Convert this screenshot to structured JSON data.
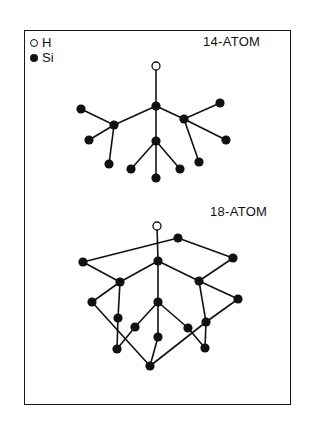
{
  "legend": {
    "items": [
      {
        "symbol": "open-circle",
        "label": "H"
      },
      {
        "symbol": "filled-circle",
        "label": "Si"
      }
    ]
  },
  "clusters": [
    {
      "title": "14-ATOM",
      "atoms": [
        {
          "id": "H",
          "type": "H",
          "x": 156,
          "y": 66
        },
        {
          "id": "c",
          "type": "Si",
          "x": 156,
          "y": 106
        },
        {
          "id": "l",
          "type": "Si",
          "x": 114,
          "y": 125
        },
        {
          "id": "r",
          "type": "Si",
          "x": 184,
          "y": 119
        },
        {
          "id": "m",
          "type": "Si",
          "x": 156,
          "y": 141
        },
        {
          "id": "l1",
          "type": "Si",
          "x": 81,
          "y": 109
        },
        {
          "id": "l2",
          "type": "Si",
          "x": 89,
          "y": 140
        },
        {
          "id": "l3",
          "type": "Si",
          "x": 109,
          "y": 164
        },
        {
          "id": "m1",
          "type": "Si",
          "x": 131,
          "y": 169
        },
        {
          "id": "m2",
          "type": "Si",
          "x": 156,
          "y": 178
        },
        {
          "id": "m3",
          "type": "Si",
          "x": 180,
          "y": 169
        },
        {
          "id": "r1",
          "type": "Si",
          "x": 220,
          "y": 103
        },
        {
          "id": "r2",
          "type": "Si",
          "x": 226,
          "y": 140
        },
        {
          "id": "r3",
          "type": "Si",
          "x": 199,
          "y": 162
        }
      ],
      "bonds": [
        [
          "H",
          "c"
        ],
        [
          "c",
          "l"
        ],
        [
          "c",
          "r"
        ],
        [
          "c",
          "m"
        ],
        [
          "l",
          "l1"
        ],
        [
          "l",
          "l2"
        ],
        [
          "l",
          "l3"
        ],
        [
          "m",
          "m1"
        ],
        [
          "m",
          "m2"
        ],
        [
          "m",
          "m3"
        ],
        [
          "r",
          "r1"
        ],
        [
          "r",
          "r2"
        ],
        [
          "r",
          "r3"
        ]
      ]
    },
    {
      "title": "18-ATOM",
      "atoms": [
        {
          "id": "H",
          "type": "H",
          "x": 157,
          "y": 226
        },
        {
          "id": "tr",
          "type": "Si",
          "x": 178,
          "y": 238
        },
        {
          "id": "L",
          "type": "Si",
          "x": 83,
          "y": 262
        },
        {
          "id": "C",
          "type": "Si",
          "x": 158,
          "y": 261
        },
        {
          "id": "R",
          "type": "Si",
          "x": 233,
          "y": 258
        },
        {
          "id": "LM",
          "type": "Si",
          "x": 120,
          "y": 282
        },
        {
          "id": "RM",
          "type": "Si",
          "x": 199,
          "y": 281
        },
        {
          "id": "FL",
          "type": "Si",
          "x": 92,
          "y": 302
        },
        {
          "id": "C2",
          "type": "Si",
          "x": 158,
          "y": 302
        },
        {
          "id": "FR",
          "type": "Si",
          "x": 238,
          "y": 299
        },
        {
          "id": "LL",
          "type": "Si",
          "x": 118,
          "y": 318
        },
        {
          "id": "CL",
          "type": "Si",
          "x": 135,
          "y": 327
        },
        {
          "id": "CR",
          "type": "Si",
          "x": 188,
          "y": 328
        },
        {
          "id": "RL",
          "type": "Si",
          "x": 206,
          "y": 322
        },
        {
          "id": "C3",
          "type": "Si",
          "x": 158,
          "y": 337
        },
        {
          "id": "BL",
          "type": "Si",
          "x": 117,
          "y": 349
        },
        {
          "id": "BR",
          "type": "Si",
          "x": 205,
          "y": 348
        },
        {
          "id": "B",
          "type": "Si",
          "x": 150,
          "y": 366
        }
      ],
      "bonds": [
        [
          "H",
          "C"
        ],
        [
          "L",
          "tr"
        ],
        [
          "tr",
          "R"
        ],
        [
          "C",
          "LM"
        ],
        [
          "C",
          "RM"
        ],
        [
          "C",
          "C2"
        ],
        [
          "L",
          "LM"
        ],
        [
          "R",
          "RM"
        ],
        [
          "LM",
          "FL"
        ],
        [
          "LM",
          "LL"
        ],
        [
          "RM",
          "FR"
        ],
        [
          "RM",
          "RL"
        ],
        [
          "C2",
          "CL"
        ],
        [
          "C2",
          "C3"
        ],
        [
          "C2",
          "CR"
        ],
        [
          "FL",
          "B"
        ],
        [
          "FR",
          "RL"
        ],
        [
          "RL",
          "B"
        ],
        [
          "LL",
          "BL"
        ],
        [
          "CL",
          "BL"
        ],
        [
          "CR",
          "BR"
        ],
        [
          "RL",
          "BR"
        ],
        [
          "C3",
          "B"
        ]
      ]
    }
  ],
  "colors": {
    "ink": "#111111",
    "background": "#ffffff"
  }
}
